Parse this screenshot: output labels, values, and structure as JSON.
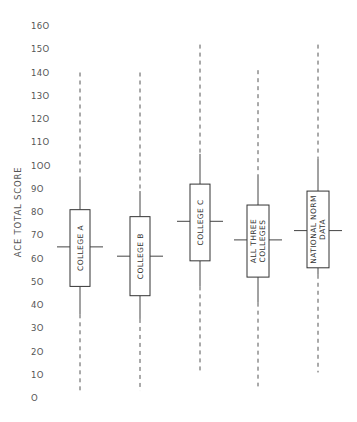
{
  "chart_data": {
    "type": "boxplot",
    "title": "",
    "xlabel": "",
    "ylabel": "ACE TOTAL SCORE",
    "ylim": [
      0,
      160
    ],
    "y_ticks": [
      0,
      10,
      20,
      30,
      40,
      50,
      60,
      70,
      80,
      90,
      100,
      110,
      120,
      130,
      140,
      150,
      160
    ],
    "grid": false,
    "legend": null,
    "categories": [
      "COLLEGE A",
      "COLLEGE B",
      "COLLEGE C",
      "ALL THREE COLLEGES",
      "NATIONAL NORM DATA"
    ],
    "series": [
      {
        "name": "COLLEGE A",
        "label_lines": [
          "COLLEGE A"
        ],
        "x_px": 80,
        "dashed_max": 140,
        "whisker_max": 94,
        "q3": 81,
        "median": 65,
        "q1": 48,
        "whisker_min": 36,
        "dashed_min": 2
      },
      {
        "name": "COLLEGE B",
        "label_lines": [
          "COLLEGE B"
        ],
        "x_px": 140,
        "dashed_max": 140,
        "whisker_max": 89,
        "q3": 78,
        "median": 61,
        "q1": 44,
        "whisker_min": 34,
        "dashed_min": 3
      },
      {
        "name": "COLLEGE C",
        "label_lines": [
          "COLLEGE C"
        ],
        "x_px": 200,
        "dashed_max": 152,
        "whisker_max": 105,
        "q3": 92,
        "median": 76,
        "q1": 59,
        "whisker_min": 48,
        "dashed_min": 11
      },
      {
        "name": "ALL THREE COLLEGES",
        "label_lines": [
          "ALL THREE",
          "COLLEGES"
        ],
        "x_px": 258,
        "dashed_max": 141,
        "whisker_max": 96,
        "q3": 83,
        "median": 68,
        "q1": 52,
        "whisker_min": 41,
        "dashed_min": 5
      },
      {
        "name": "NATIONAL NORM DATA",
        "label_lines": [
          "NATIONAL NORM",
          "DATA"
        ],
        "x_px": 318,
        "dashed_max": 152,
        "whisker_max": 103,
        "q3": 89,
        "median": 72,
        "q1": 56,
        "whisker_min": 53,
        "dashed_min": 11
      }
    ]
  },
  "axis": {
    "title": "ACE TOTAL SCORE"
  },
  "colors": {
    "line": "#444444",
    "text": "#555555",
    "background": "#ffffff"
  }
}
